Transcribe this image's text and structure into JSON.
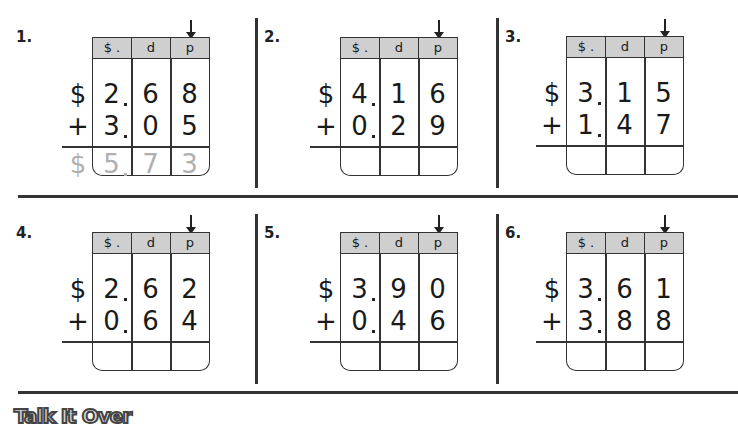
{
  "column_headers": [
    "$ .",
    "d",
    "p"
  ],
  "problems": [
    {
      "number": "1.",
      "sign1": "$",
      "sign2": "+",
      "row1": [
        "2",
        "6",
        "8"
      ],
      "row2": [
        "3",
        "0",
        "5"
      ],
      "answer_sign": "$",
      "answer": [
        "5",
        "7",
        "3"
      ]
    },
    {
      "number": "2.",
      "sign1": "$",
      "sign2": "+",
      "row1": [
        "4",
        "1",
        "6"
      ],
      "row2": [
        "0",
        "2",
        "9"
      ],
      "answer_sign": "",
      "answer": [
        "",
        "",
        ""
      ]
    },
    {
      "number": "3.",
      "sign1": "$",
      "sign2": "+",
      "row1": [
        "3",
        "1",
        "5"
      ],
      "row2": [
        "1",
        "4",
        "7"
      ],
      "answer_sign": "",
      "answer": [
        "",
        "",
        ""
      ]
    },
    {
      "number": "4.",
      "sign1": "$",
      "sign2": "+",
      "row1": [
        "2",
        "6",
        "2"
      ],
      "row2": [
        "0",
        "6",
        "4"
      ],
      "answer_sign": "",
      "answer": [
        "",
        "",
        ""
      ]
    },
    {
      "number": "5.",
      "sign1": "$",
      "sign2": "+",
      "row1": [
        "3",
        "9",
        "0"
      ],
      "row2": [
        "0",
        "4",
        "6"
      ],
      "answer_sign": "",
      "answer": [
        "",
        "",
        ""
      ]
    },
    {
      "number": "6.",
      "sign1": "$",
      "sign2": "+",
      "row1": [
        "3",
        "6",
        "1"
      ],
      "row2": [
        "3",
        "8",
        "8"
      ],
      "answer_sign": "",
      "answer": [
        "",
        "",
        ""
      ]
    }
  ],
  "footer": {
    "heading": "Talk It Over"
  }
}
